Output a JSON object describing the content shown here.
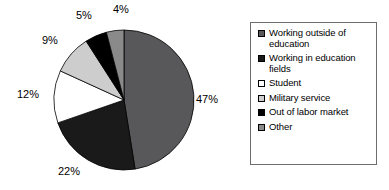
{
  "chart_data": {
    "type": "pie",
    "title": "",
    "labels": [
      "Working outside of education",
      "Working in education fields",
      "Student",
      "Military service",
      "Out of labor market",
      "Other"
    ],
    "values": [
      47,
      22,
      12,
      9,
      5,
      4
    ],
    "value_labels": [
      "47%",
      "22%",
      "12%",
      "9%",
      "5%",
      "4%"
    ],
    "colors": [
      "#58585a",
      "#1a1a1a",
      "#ffffff",
      "#cdcdcd",
      "#000000",
      "#8a8a8a"
    ],
    "units": "percent",
    "start_angle_deg": 0,
    "direction": "clockwise",
    "legend_position": "right",
    "legend_border": true,
    "grid": false
  },
  "pie": {
    "slices": [
      {
        "name": "working-outside-of-education",
        "label": "47%",
        "value": 47,
        "color": "#58585a"
      },
      {
        "name": "working-in-education-fields",
        "label": "22%",
        "value": 22,
        "color": "#1a1a1a"
      },
      {
        "name": "student",
        "label": "12%",
        "value": 12,
        "color": "#ffffff"
      },
      {
        "name": "military-service",
        "label": "9%",
        "value": 9,
        "color": "#cdcdcd"
      },
      {
        "name": "out-of-labor-market",
        "label": "5%",
        "value": 5,
        "color": "#000000"
      },
      {
        "name": "other",
        "label": "4%",
        "value": 4,
        "color": "#8a8a8a"
      }
    ]
  },
  "legend": {
    "items": [
      {
        "label": "Working outside of education",
        "color": "#58585a"
      },
      {
        "label": "Working in education fields",
        "color": "#1a1a1a"
      },
      {
        "label": "Student",
        "color": "#ffffff"
      },
      {
        "label": "Military service",
        "color": "#cdcdcd"
      },
      {
        "label": "Out of labor market",
        "color": "#000000"
      },
      {
        "label": "Other",
        "color": "#8a8a8a"
      }
    ]
  }
}
